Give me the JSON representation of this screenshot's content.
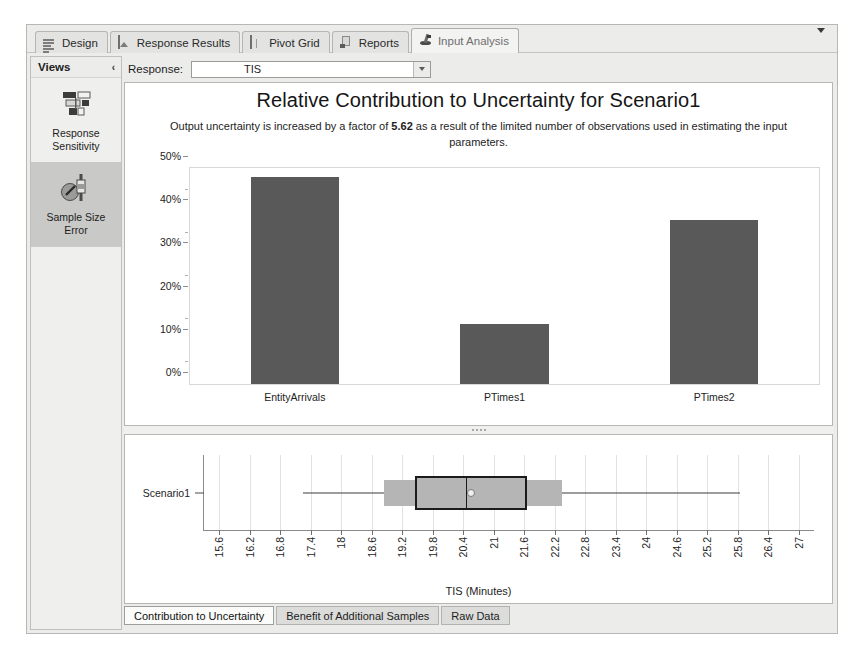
{
  "window": {
    "tabs": [
      {
        "label": "Design",
        "icon": "lines-icon",
        "active": false
      },
      {
        "label": "Response Results",
        "icon": "image-icon",
        "active": false
      },
      {
        "label": "Pivot Grid",
        "icon": "grid-icon",
        "active": false
      },
      {
        "label": "Reports",
        "icon": "report-icon",
        "active": false
      },
      {
        "label": "Input Analysis",
        "icon": "analysis-icon",
        "active": true
      }
    ],
    "overflow_icon": "chevron-down-icon"
  },
  "views": {
    "title": "Views",
    "collapse_icon": "chevron-left-icon",
    "items": [
      {
        "label": "Response\nSensitivity",
        "line1": "Response",
        "line2": "Sensitivity",
        "icon": "sensitivity-icon",
        "selected": false
      },
      {
        "label": "Sample Size\nError",
        "line1": "Sample Size",
        "line2": "Error",
        "icon": "sample-size-error-icon",
        "selected": true
      }
    ]
  },
  "response": {
    "label": "Response:",
    "value": "TIS",
    "placeholder": "TIS",
    "dropdown_icon": "caret-down-icon"
  },
  "bottom_tabs": [
    {
      "label": "Contribution to Uncertainty",
      "active": true
    },
    {
      "label": "Benefit of Additional Samples",
      "active": false
    },
    {
      "label": "Raw Data",
      "active": false
    }
  ],
  "chart_data": [
    {
      "type": "bar",
      "title": "Relative Contribution to Uncertainty for Scenario1",
      "subtitle_prefix": "Output uncertainty is increased by a factor of ",
      "subtitle_value": "5.62",
      "subtitle_suffix": " as a result of the limited number of observations used in estimating the input parameters.",
      "categories": [
        "EntityArrivals",
        "PTimes1",
        "PTimes2"
      ],
      "values": [
        48,
        14,
        38
      ],
      "xlabel": "",
      "ylabel": "",
      "ylim": [
        0,
        50
      ],
      "yticks": [
        0,
        10,
        20,
        30,
        40,
        50
      ],
      "ytick_labels": [
        "0%",
        "10%",
        "20%",
        "30%",
        "40%",
        "50%"
      ],
      "grid": false,
      "legend": "none",
      "bar_color": "#595959"
    },
    {
      "type": "boxplot",
      "title": "",
      "xlabel": "TIS (Minutes)",
      "ylabel": "",
      "categories": [
        "Scenario1"
      ],
      "xlim": [
        15.3,
        27.3
      ],
      "xticks": [
        15.6,
        16.2,
        16.8,
        17.4,
        18,
        18.6,
        19.2,
        19.8,
        20.4,
        21,
        21.6,
        22.2,
        22.8,
        23.4,
        24,
        24.6,
        25.2,
        25.8,
        26.4,
        27
      ],
      "xtick_labels": [
        "15.6",
        "16.2",
        "16.8",
        "17.4",
        "18",
        "18.6",
        "19.2",
        "19.8",
        "20.4",
        "21",
        "21.6",
        "22.2",
        "22.8",
        "23.4",
        "24",
        "24.6",
        "25.2",
        "25.8",
        "26.4",
        "27"
      ],
      "boxes": [
        {
          "name": "Scenario1",
          "whisker_low": 17.25,
          "q1": 19.45,
          "median": 20.45,
          "mean": 20.55,
          "q3": 21.65,
          "whisker_high": 25.85,
          "ci_low": 18.85,
          "ci_high": 22.35,
          "box_color": "#b5b5b5",
          "ci_color": "#b5b5b5"
        }
      ],
      "grid": true,
      "legend": "none"
    }
  ]
}
